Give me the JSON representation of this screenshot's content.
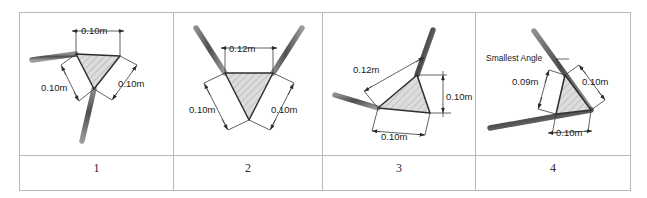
{
  "figure": {
    "title_present": false,
    "panel_count": 4,
    "colors": {
      "arm_stroke": "#6b6b6b",
      "triangle_fill": "#dcdcdc",
      "triangle_hatch": "#9a9a9a",
      "triangle_stroke": "#2e2e2e",
      "dimension_line": "#3a3a3a",
      "table_border": "#b9b9b9",
      "text": "#1a1a1a",
      "background": "#ffffff"
    },
    "panels": [
      {
        "id": "panel-1",
        "number": "1",
        "dimensions": [
          {
            "name": "top-edge",
            "label": "0.10m"
          },
          {
            "name": "right-edge",
            "label": "0.10m"
          },
          {
            "name": "left-edge",
            "label": "0.10m"
          }
        ],
        "annotations": []
      },
      {
        "id": "panel-2",
        "number": "2",
        "dimensions": [
          {
            "name": "top-edge",
            "label": "0.12m"
          },
          {
            "name": "left-edge",
            "label": "0.10m"
          },
          {
            "name": "right-edge",
            "label": "0.10m"
          }
        ],
        "annotations": []
      },
      {
        "id": "panel-3",
        "number": "3",
        "dimensions": [
          {
            "name": "upper-left-edge",
            "label": "0.12m"
          },
          {
            "name": "right-edge",
            "label": "0.10m"
          },
          {
            "name": "bottom-edge",
            "label": "0.10m"
          }
        ],
        "annotations": []
      },
      {
        "id": "panel-4",
        "number": "4",
        "dimensions": [
          {
            "name": "upper-right-edge",
            "label": "0.10m"
          },
          {
            "name": "left-edge",
            "label": "0.09m"
          },
          {
            "name": "bottom-edge",
            "label": "0.10m"
          }
        ],
        "annotations": [
          {
            "name": "smallest-angle-callout",
            "label": "Smallest Angle"
          }
        ]
      }
    ]
  }
}
